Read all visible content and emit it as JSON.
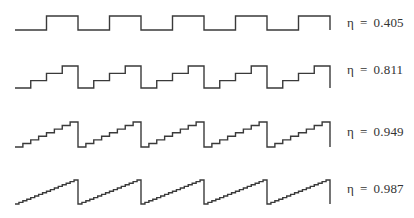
{
  "figure": {
    "stroke_color": "#3a3a3a",
    "x_start": 15,
    "x_end": 330,
    "period": 63,
    "rise_width": 63,
    "waves": [
      {
        "id": "wave-1",
        "levels": 2,
        "y_low": 30,
        "y_high": 16,
        "label_symbol": "η",
        "label_eq": "=",
        "label_value": "0.405",
        "label_y": 16
      },
      {
        "id": "wave-2",
        "levels": 4,
        "y_low": 88,
        "y_high": 66,
        "label_symbol": "η",
        "label_eq": "=",
        "label_value": "0.811",
        "label_y": 63
      },
      {
        "id": "wave-3",
        "levels": 8,
        "y_low": 147,
        "y_high": 122,
        "label_symbol": "η",
        "label_eq": "=",
        "label_value": "0.949",
        "label_y": 125
      },
      {
        "id": "wave-4",
        "levels": 16,
        "y_low": 204,
        "y_high": 180,
        "label_symbol": "η",
        "label_eq": "=",
        "label_value": "0.987",
        "label_y": 182
      }
    ]
  }
}
